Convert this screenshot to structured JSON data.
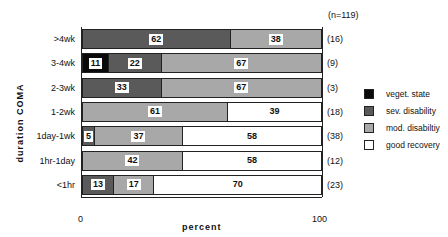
{
  "chart_data": {
    "type": "bar",
    "orientation": "horizontal",
    "stacked": true,
    "title": "",
    "total_label": "(n=119)",
    "xlabel": "percent",
    "ylabel": "duration  COMA",
    "xlim": [
      0,
      100
    ],
    "x_ticks": [
      "0",
      "100"
    ],
    "categories": [
      ">4wk",
      "3-4wk",
      "2-3wk",
      "1-2wk",
      "1day-1wk",
      "1hr-1day",
      "<1hr"
    ],
    "counts": [
      "(16)",
      "(9)",
      "(3)",
      "(18)",
      "(38)",
      "(12)",
      "(23)"
    ],
    "series": [
      {
        "name": "veget. state",
        "color": "#0a0a0a",
        "values": [
          0,
          11,
          0,
          0,
          0,
          0,
          0
        ]
      },
      {
        "name": "sev. disability",
        "color": "#5a5a5a",
        "values": [
          62,
          22,
          33,
          0,
          5,
          0,
          13
        ]
      },
      {
        "name": "mod. disabiltiy",
        "color": "#a8a8a8",
        "values": [
          38,
          67,
          67,
          61,
          37,
          42,
          17
        ]
      },
      {
        "name": "good recovery",
        "color": "#ffffff",
        "values": [
          0,
          0,
          0,
          39,
          58,
          58,
          70
        ]
      }
    ],
    "legend_position": "right"
  }
}
